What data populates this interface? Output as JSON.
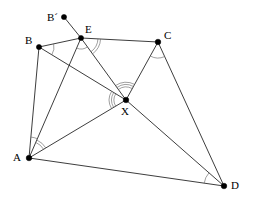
{
  "figure": {
    "stroke_color": "#1a1a1a",
    "arc_color": "#6b6b6b",
    "vertex_color": "#000000",
    "background_color": "#ffffff",
    "width": 254,
    "height": 201
  },
  "points": [
    {
      "id": "Bprime",
      "label": "B´",
      "x": 64,
      "y": 17,
      "label_x": 47,
      "label_y": 12,
      "dot_r": 2.6
    },
    {
      "id": "E",
      "label": "E",
      "x": 81,
      "y": 38,
      "label_x": 85,
      "label_y": 24,
      "dot_r": 2.6
    },
    {
      "id": "B",
      "label": "B",
      "x": 39,
      "y": 47,
      "label_x": 25,
      "label_y": 35,
      "dot_r": 2.6
    },
    {
      "id": "C",
      "label": "C",
      "x": 158,
      "y": 42,
      "label_x": 164,
      "label_y": 30,
      "dot_r": 2.8
    },
    {
      "id": "X",
      "label": "X",
      "x": 126,
      "y": 100,
      "label_x": 121,
      "label_y": 106,
      "dot_r": 2.8
    },
    {
      "id": "A",
      "label": "A",
      "x": 29,
      "y": 158,
      "label_x": 13,
      "label_y": 152,
      "dot_r": 2.8
    },
    {
      "id": "D",
      "label": "D",
      "x": 224,
      "y": 186,
      "label_x": 231,
      "label_y": 180,
      "dot_r": 2.8
    }
  ],
  "segments": [
    {
      "id": "seg-Bprime-E",
      "from": "Bprime",
      "to": "E"
    },
    {
      "id": "seg-B-E",
      "from": "B",
      "to": "E"
    },
    {
      "id": "seg-E-C",
      "from": "E",
      "to": "C"
    },
    {
      "id": "seg-B-A",
      "from": "B",
      "to": "A"
    },
    {
      "id": "seg-B-X",
      "from": "B",
      "to": "X"
    },
    {
      "id": "seg-A-E",
      "from": "A",
      "to": "E"
    },
    {
      "id": "seg-A-X",
      "from": "A",
      "to": "X"
    },
    {
      "id": "seg-A-D",
      "from": "A",
      "to": "D"
    },
    {
      "id": "seg-E-X",
      "from": "E",
      "to": "X"
    },
    {
      "id": "seg-C-X",
      "from": "C",
      "to": "X"
    },
    {
      "id": "seg-C-D",
      "from": "C",
      "to": "D"
    },
    {
      "id": "seg-X-D",
      "from": "X",
      "to": "D"
    }
  ],
  "angle_marks": [
    {
      "id": "angle-at-B",
      "vertex": "B",
      "ray1": "E",
      "ray2": "X",
      "arcs": 1,
      "radius": 15,
      "gap": 2.6
    },
    {
      "id": "angle-at-E-right",
      "vertex": "E",
      "ray1": "C",
      "ray2": "X",
      "arcs": 2,
      "radius": 17,
      "gap": 2.6
    },
    {
      "id": "angle-at-E-left",
      "vertex": "E",
      "ray1": "X",
      "ray2": "A",
      "arcs": 1,
      "radius": 11,
      "gap": 2.6
    },
    {
      "id": "angle-at-C",
      "vertex": "C",
      "ray1": "X",
      "ray2": "D",
      "arcs": 1,
      "radius": 16,
      "gap": 2.6
    },
    {
      "id": "angle-at-X-top",
      "vertex": "X",
      "ray1": "E",
      "ray2": "C",
      "arcs": 3,
      "radius": 13,
      "gap": 2.4
    },
    {
      "id": "angle-at-X-left",
      "vertex": "X",
      "ray1": "B",
      "ray2": "A",
      "arcs": 3,
      "radius": 12,
      "gap": 2.4
    },
    {
      "id": "angle-at-A",
      "vertex": "A",
      "ray1": "B",
      "ray2": "E",
      "arcs": 1,
      "radius": 21,
      "gap": 2.6
    },
    {
      "id": "angle-at-A-2",
      "vertex": "A",
      "ray1": "E",
      "ray2": "X",
      "arcs": 2,
      "radius": 17,
      "gap": 2.6
    },
    {
      "id": "angle-at-D",
      "vertex": "D",
      "ray1": "X",
      "ray2": "A",
      "arcs": 1,
      "radius": 20,
      "gap": 2.6
    }
  ]
}
